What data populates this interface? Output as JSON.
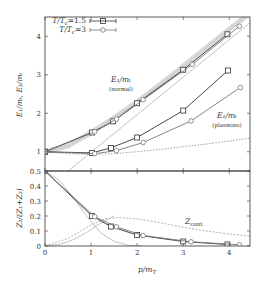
{
  "chart_data": [
    {
      "panel": "upper",
      "type": "line",
      "ylabel": "E_1/m_T, E_2/m_T",
      "xlabel": "",
      "xlim": [
        0,
        4.45
      ],
      "ylim": [
        0.5,
        4.5
      ],
      "yticks": [
        1,
        2,
        3,
        4
      ],
      "xticks": [
        0,
        1,
        2,
        3,
        4
      ],
      "legend": {
        "position": "top-left",
        "entries": [
          {
            "label": "T/T_c=1.5",
            "marker": "square"
          },
          {
            "label": "T/T_c=3",
            "marker": "circle"
          }
        ]
      },
      "annotations": [
        {
          "text": "E_1/m_T",
          "subtext": "(normal)",
          "x": 1.55,
          "y": 2.75
        },
        {
          "text": "E_2/m_T",
          "subtext": "(plasmino)",
          "x": 3.9,
          "y": 1.85
        }
      ],
      "series": [
        {
          "name": "E1 T/Tc=1.5",
          "marker": "square",
          "x": [
            0,
            1.02,
            1.48,
            2.0,
            3.0,
            3.96
          ],
          "y": [
            1.0,
            1.5,
            1.79,
            2.26,
            3.13,
            4.05
          ]
        },
        {
          "name": "E1 T/Tc=3",
          "marker": "circle",
          "x": [
            0,
            1.08,
            1.55,
            2.13,
            3.2,
            4.22
          ],
          "y": [
            1.0,
            1.52,
            1.85,
            2.35,
            3.27,
            4.26
          ]
        },
        {
          "name": "E2 T/Tc=1.5",
          "marker": "square",
          "x": [
            0,
            1.02,
            1.43,
            2.0,
            3.0,
            3.97
          ],
          "y": [
            1.0,
            0.97,
            1.1,
            1.37,
            2.07,
            3.11
          ]
        },
        {
          "name": "E2 T/Tc=3",
          "marker": "circle",
          "x": [
            0,
            1.08,
            1.55,
            2.13,
            3.17,
            4.24
          ],
          "y": [
            1.0,
            0.95,
            1.03,
            1.24,
            1.8,
            2.67
          ]
        },
        {
          "name": "HTL normal band",
          "style": "grey-band",
          "x": [
            0,
            0.5,
            1,
            1.5,
            2,
            2.5,
            3,
            3.5,
            4,
            4.45
          ],
          "y": [
            1.0,
            1.15,
            1.5,
            1.88,
            2.3,
            2.75,
            3.22,
            3.7,
            4.18,
            4.6
          ]
        },
        {
          "name": "light cone",
          "style": "grey-solid",
          "x": [
            0.5,
            4.45
          ],
          "y": [
            0.5,
            4.35
          ]
        },
        {
          "name": "HTL plasmino",
          "style": "dashed",
          "x": [
            0,
            0.5,
            1,
            1.5,
            2,
            2.5,
            3,
            3.5,
            4,
            4.45
          ],
          "y": [
            1.0,
            0.95,
            0.93,
            0.95,
            1.0,
            1.06,
            1.13,
            1.2,
            1.28,
            1.35
          ]
        }
      ]
    },
    {
      "panel": "lower",
      "type": "line",
      "ylabel": "Z_2/(Z_1+Z_2)",
      "xlabel": "p/m_T",
      "xlim": [
        0,
        4.45
      ],
      "ylim": [
        0,
        0.5
      ],
      "yticks": [
        0,
        0.1,
        0.2,
        0.3,
        0.4,
        0.5
      ],
      "xticks": [
        0,
        1,
        2,
        3,
        4
      ],
      "annotations": [
        {
          "text": "Z_cont.",
          "x": 3.0,
          "y": 0.19
        }
      ],
      "series": [
        {
          "name": "T/Tc=1.5",
          "marker": "square",
          "x": [
            0,
            1.02,
            1.43,
            2.0,
            3.0,
            3.96
          ],
          "y": [
            0.5,
            0.2,
            0.13,
            0.073,
            0.03,
            0.01
          ]
        },
        {
          "name": "T/Tc=3",
          "marker": "circle",
          "x": [
            0,
            1.08,
            1.55,
            2.13,
            3.17,
            4.22
          ],
          "y": [
            0.5,
            0.195,
            0.128,
            0.07,
            0.028,
            0.008
          ]
        },
        {
          "name": "Z_cont",
          "style": "grey-dashed",
          "x": [
            0,
            0.5,
            1,
            1.3,
            1.6,
            2,
            2.5,
            3,
            3.5,
            4,
            4.45
          ],
          "y": [
            0.0,
            0.05,
            0.14,
            0.18,
            0.19,
            0.18,
            0.155,
            0.125,
            0.1,
            0.08,
            0.065
          ]
        },
        {
          "name": "HTL plasmino residue",
          "style": "grey-solid",
          "x": [
            0,
            0.3,
            0.6,
            0.9,
            1.2,
            1.5,
            1.8,
            2.1
          ],
          "y": [
            0.5,
            0.44,
            0.33,
            0.2,
            0.09,
            0.03,
            0.005,
            0.0
          ]
        },
        {
          "name": "rising grey",
          "style": "grey-solid",
          "x": [
            0,
            0.3,
            0.6,
            0.9,
            1.2,
            1.5
          ],
          "y": [
            0.0,
            0.01,
            0.04,
            0.09,
            0.15,
            0.2
          ]
        }
      ]
    }
  ],
  "labels": {
    "upper_ylabel": "E₁/mₜ, E₂/mₜ",
    "lower_ylabel": "Z₂/(Z₁+Z₂)",
    "xlabel": "p/m",
    "xlabel_sub": "T",
    "legend_1": "T/T",
    "legend_1_sub": "c",
    "legend_1_val": "=1.5",
    "legend_2": "T/T",
    "legend_2_sub": "c",
    "legend_2_val": "=3",
    "e1": "E₁/mₜ",
    "e1_sub": "(normal)",
    "e2": "E₂/mₜ",
    "e2_sub": "(plasmino)",
    "zcont": "Z",
    "zcont_sub": "cont."
  }
}
